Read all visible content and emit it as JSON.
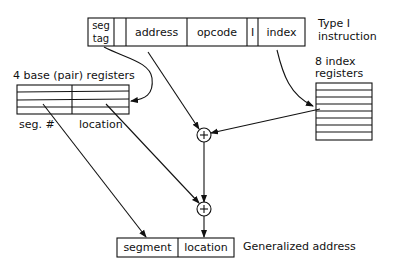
{
  "instruction": {
    "fields": [
      "seg\ntag",
      "",
      "address",
      "opcode",
      "I",
      "index"
    ],
    "seg_tag_line1": "seg",
    "seg_tag_line2": "tag",
    "address": "address",
    "opcode": "opcode",
    "indirect": "I",
    "index": "index",
    "caption_line1": "Type I",
    "caption_line2": "instruction"
  },
  "base_registers": {
    "title": "4 base (pair) registers",
    "col_left": "seg. #",
    "col_right": "location",
    "rows": 4
  },
  "index_registers": {
    "title_line1": "8 index",
    "title_line2": "registers",
    "rows": 8
  },
  "adders": [
    "+",
    "+"
  ],
  "generalized_address": {
    "segment": "segment",
    "location": "location",
    "caption": "Generalized address"
  }
}
